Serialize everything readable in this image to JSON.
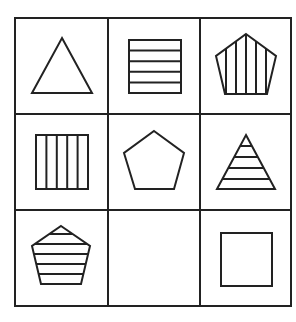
{
  "puzzle": {
    "type": "3x3 figure-reasoning matrix",
    "stroke_color": "#222222",
    "background": "#ffffff",
    "cells": [
      {
        "row": 1,
        "col": 1,
        "shape": "triangle",
        "fill": "none"
      },
      {
        "row": 1,
        "col": 2,
        "shape": "square",
        "fill": "horizontal-stripes",
        "stripe_count": 5
      },
      {
        "row": 1,
        "col": 3,
        "shape": "pentagon",
        "fill": "vertical-stripes"
      },
      {
        "row": 2,
        "col": 1,
        "shape": "square",
        "fill": "vertical-stripes",
        "stripe_count": 5
      },
      {
        "row": 2,
        "col": 2,
        "shape": "pentagon",
        "fill": "none"
      },
      {
        "row": 2,
        "col": 3,
        "shape": "triangle",
        "fill": "horizontal-stripes"
      },
      {
        "row": 3,
        "col": 1,
        "shape": "pentagon",
        "fill": "horizontal-stripes"
      },
      {
        "row": 3,
        "col": 2,
        "shape": "empty",
        "fill": "missing"
      },
      {
        "row": 3,
        "col": 3,
        "shape": "square",
        "fill": "none"
      }
    ]
  }
}
